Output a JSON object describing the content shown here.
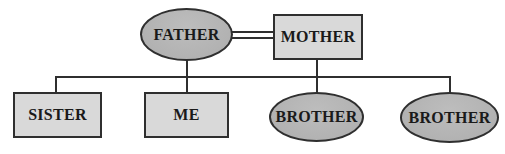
{
  "diagram": {
    "type": "family-tree",
    "background": "#ffffff",
    "colors": {
      "ellipse_fill": "#b6b6b6",
      "rect_fill": "#d9d9d9",
      "border": "#2f2f2f",
      "line": "#2f2f2f",
      "text": "#1a1a1a"
    },
    "nodes": {
      "father": {
        "label": "FATHER",
        "shape": "ellipse"
      },
      "mother": {
        "label": "MOTHER",
        "shape": "rect"
      },
      "sister": {
        "label": "SISTER",
        "shape": "rect"
      },
      "me": {
        "label": "ME",
        "shape": "rect"
      },
      "brother1": {
        "label": "BROTHER",
        "shape": "ellipse"
      },
      "brother2": {
        "label": "BROTHER",
        "shape": "ellipse"
      }
    },
    "relationships": {
      "marriage": {
        "between": [
          "FATHER",
          "MOTHER"
        ],
        "style": "double-line"
      },
      "children_of_marriage": [
        "SISTER",
        "ME",
        "BROTHER",
        "BROTHER"
      ]
    }
  }
}
